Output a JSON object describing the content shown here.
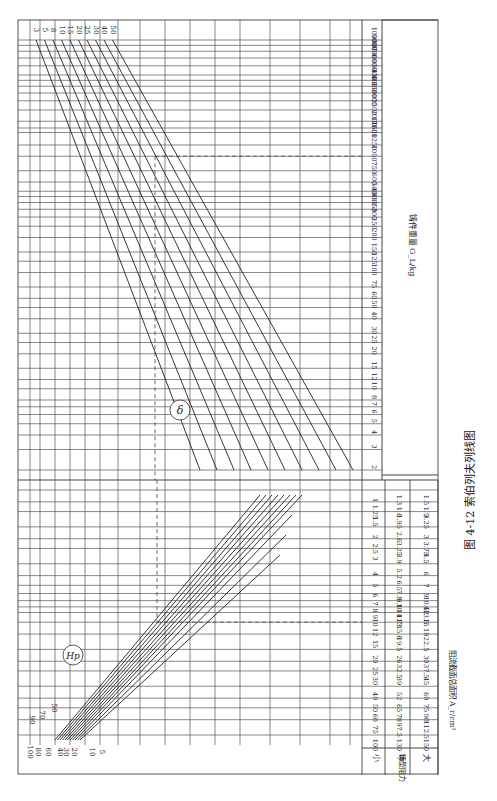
{
  "figure": {
    "caption_number": "图 4-12",
    "caption_title": "索伯列夫列线图",
    "orientation": "rotated-90"
  },
  "chart_data": [
    {
      "type": "line",
      "title": "δ",
      "description": "Upper nomogram: casting weight scale vs δ family of lines",
      "x_axis_label": "铸件重量 G_L/kg",
      "x_ticks": [
        "2",
        "3",
        "4",
        "5",
        "6",
        "7",
        "8",
        "10",
        "12",
        "15",
        "20",
        "25",
        "30",
        "40",
        "50",
        "60",
        "75",
        "100",
        "125",
        "150",
        "200",
        "250",
        "300",
        "350",
        "400",
        "450",
        "500",
        "600",
        "750",
        "1000",
        "1250",
        "1600",
        "1750",
        "2000",
        "2500",
        "3000",
        "3500",
        "4000",
        "4500",
        "5000",
        "6000",
        "7000",
        "8000",
        "9000",
        "10000"
      ],
      "series_labels": [
        "3",
        "5",
        "8",
        "10",
        "15",
        "20",
        "25",
        "30",
        "40",
        "50"
      ],
      "guide": {
        "dashed_reference": true,
        "x_value": "1000"
      }
    },
    {
      "type": "line",
      "title": "H_p",
      "description": "Lower nomogram: gating cross-section area vs H_p family of lines",
      "x_axis_label": "阻流截面总面积 A_r/cm²",
      "series_labels": [
        "5",
        "10",
        "20",
        "30",
        "40",
        "50",
        "60",
        "70",
        "80",
        "90",
        "100"
      ],
      "table": {
        "row_header": "铸型阻力",
        "columns": [
          "小",
          "中",
          "大"
        ],
        "rows": [
          [
            "1",
            "1.3",
            "1.5"
          ],
          [
            "1.25",
            "1.6",
            "1.9"
          ],
          [
            "1.5",
            "1.95",
            "3.25"
          ],
          [
            "2",
            "2.6",
            "3"
          ],
          [
            "2.5",
            "3.25",
            "3.75"
          ],
          [
            "3",
            "3.9",
            "4.5"
          ],
          [
            "4",
            "5.2",
            "6"
          ],
          [
            "5",
            "6.5",
            "7"
          ],
          [
            "6",
            "7.8",
            "9"
          ],
          [
            "7",
            "9.1",
            "10.6"
          ],
          [
            "8",
            "10.4",
            "12"
          ],
          [
            "9",
            "11.7",
            "13.5"
          ],
          [
            "10",
            "13",
            "15"
          ],
          [
            "12",
            "15.6",
            "18"
          ],
          [
            "15",
            "19.5",
            "22.5"
          ],
          [
            "20",
            "26",
            "30"
          ],
          [
            "25",
            "32.5",
            "37.5"
          ],
          [
            "30",
            "39",
            "45"
          ],
          [
            "40",
            "52",
            "60"
          ],
          [
            "50",
            "65",
            "75"
          ],
          [
            "60",
            "78",
            "90"
          ],
          [
            "75",
            "97.5",
            "112.5"
          ],
          [
            "100",
            "130",
            "150"
          ]
        ]
      },
      "guide": {
        "dashed_reference": true,
        "x_value": "12"
      }
    }
  ]
}
